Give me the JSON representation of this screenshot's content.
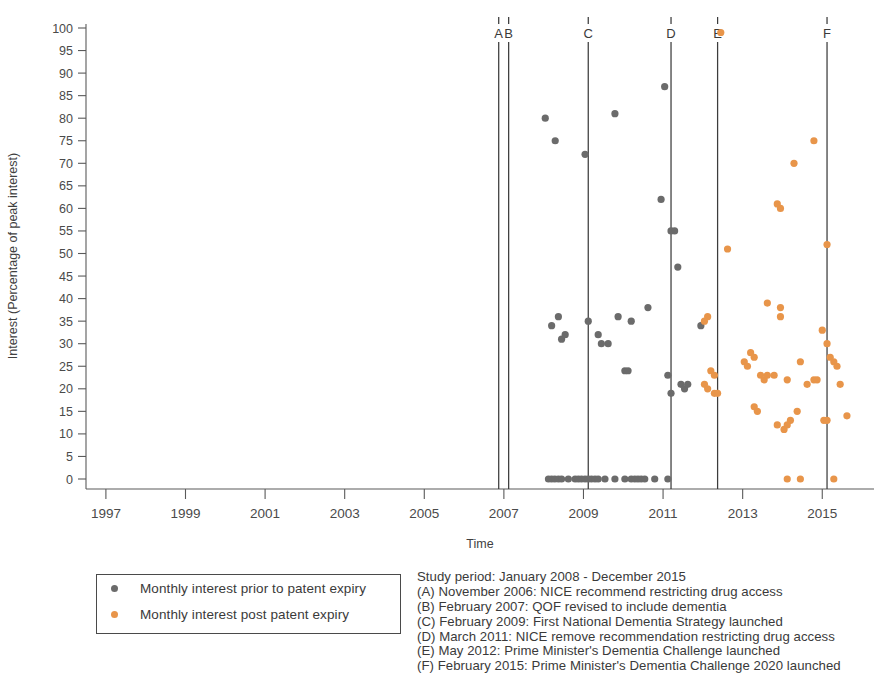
{
  "chart_data": {
    "type": "scatter",
    "title": "",
    "xlabel": "Time",
    "ylabel": "Interest (Percentage of peak interest)",
    "xlim": [
      1996.5,
      2016.3
    ],
    "ylim": [
      0,
      100
    ],
    "xticks": [
      "1997",
      "1999",
      "2001",
      "2003",
      "2005",
      "2007",
      "2009",
      "2011",
      "2013",
      "2015"
    ],
    "xtick_values": [
      1997,
      1999,
      2001,
      2003,
      2005,
      2007,
      2009,
      2011,
      2013,
      2015
    ],
    "yticks": [
      "0",
      "5",
      "10",
      "15",
      "20",
      "25",
      "30",
      "35",
      "40",
      "45",
      "50",
      "55",
      "60",
      "65",
      "70",
      "75",
      "80",
      "85",
      "90",
      "95",
      "100"
    ],
    "ytick_values": [
      0,
      5,
      10,
      15,
      20,
      25,
      30,
      35,
      40,
      45,
      50,
      55,
      60,
      65,
      70,
      75,
      80,
      85,
      90,
      95,
      100
    ],
    "grid": false,
    "legend_position": "below-left",
    "series": [
      {
        "name": "Monthly interest prior to patent expiry",
        "color": "#6b6b6b",
        "points": [
          [
            2008.12,
            0
          ],
          [
            2008.2,
            0
          ],
          [
            2008.28,
            0
          ],
          [
            2008.37,
            0
          ],
          [
            2008.45,
            0
          ],
          [
            2008.62,
            0
          ],
          [
            2008.79,
            0
          ],
          [
            2008.87,
            0
          ],
          [
            2008.95,
            0
          ],
          [
            2009.04,
            0
          ],
          [
            2009.12,
            0
          ],
          [
            2009.2,
            0
          ],
          [
            2009.29,
            0
          ],
          [
            2009.37,
            0
          ],
          [
            2009.54,
            0
          ],
          [
            2009.79,
            0
          ],
          [
            2010.04,
            0
          ],
          [
            2010.2,
            0
          ],
          [
            2010.29,
            0
          ],
          [
            2010.37,
            0
          ],
          [
            2010.45,
            0
          ],
          [
            2010.54,
            0
          ],
          [
            2010.79,
            0
          ],
          [
            2011.12,
            0
          ],
          [
            2008.04,
            80
          ],
          [
            2008.29,
            75
          ],
          [
            2009.04,
            72
          ],
          [
            2009.79,
            81
          ],
          [
            2011.04,
            87
          ],
          [
            2010.95,
            62
          ],
          [
            2011.2,
            55
          ],
          [
            2011.29,
            55
          ],
          [
            2011.37,
            47
          ],
          [
            2010.62,
            38
          ],
          [
            2010.2,
            35
          ],
          [
            2009.87,
            36
          ],
          [
            2008.37,
            36
          ],
          [
            2008.2,
            34
          ],
          [
            2008.45,
            31
          ],
          [
            2008.54,
            32
          ],
          [
            2009.12,
            35
          ],
          [
            2009.37,
            32
          ],
          [
            2009.45,
            30
          ],
          [
            2009.62,
            30
          ],
          [
            2010.04,
            24
          ],
          [
            2010.12,
            24
          ],
          [
            2011.12,
            23
          ],
          [
            2011.2,
            19
          ],
          [
            2011.45,
            21
          ],
          [
            2011.54,
            20
          ],
          [
            2011.62,
            21
          ],
          [
            2011.95,
            34
          ]
        ]
      },
      {
        "name": "Monthly interest post patent expiry",
        "color": "#e8954a",
        "points": [
          [
            2012.45,
            99
          ],
          [
            2014.79,
            75
          ],
          [
            2014.29,
            70
          ],
          [
            2013.87,
            61
          ],
          [
            2013.95,
            60
          ],
          [
            2015.12,
            52
          ],
          [
            2012.62,
            51
          ],
          [
            2013.62,
            39
          ],
          [
            2013.95,
            38
          ],
          [
            2013.95,
            36
          ],
          [
            2012.12,
            36
          ],
          [
            2012.04,
            35
          ],
          [
            2015.0,
            33
          ],
          [
            2015.12,
            30
          ],
          [
            2013.2,
            28
          ],
          [
            2013.29,
            27
          ],
          [
            2013.04,
            26
          ],
          [
            2013.12,
            25
          ],
          [
            2014.45,
            26
          ],
          [
            2015.2,
            27
          ],
          [
            2015.29,
            26
          ],
          [
            2015.37,
            25
          ],
          [
            2012.2,
            24
          ],
          [
            2012.29,
            23
          ],
          [
            2013.45,
            23
          ],
          [
            2013.54,
            22
          ],
          [
            2013.62,
            23
          ],
          [
            2013.79,
            23
          ],
          [
            2014.12,
            22
          ],
          [
            2014.62,
            21
          ],
          [
            2014.79,
            22
          ],
          [
            2014.87,
            22
          ],
          [
            2015.45,
            21
          ],
          [
            2012.04,
            21
          ],
          [
            2012.12,
            20
          ],
          [
            2012.29,
            19
          ],
          [
            2012.37,
            19
          ],
          [
            2013.29,
            16
          ],
          [
            2013.37,
            15
          ],
          [
            2014.37,
            15
          ],
          [
            2014.2,
            13
          ],
          [
            2015.04,
            13
          ],
          [
            2015.12,
            13
          ],
          [
            2015.62,
            14
          ],
          [
            2013.87,
            12
          ],
          [
            2014.04,
            11
          ],
          [
            2014.12,
            12
          ],
          [
            2014.12,
            0
          ],
          [
            2014.45,
            0
          ],
          [
            2015.29,
            0
          ]
        ]
      }
    ],
    "event_lines": [
      {
        "label": "A",
        "x": 2006.87
      },
      {
        "label": "B",
        "x": 2007.12
      },
      {
        "label": "C",
        "x": 2009.12
      },
      {
        "label": "D",
        "x": 2011.2
      },
      {
        "label": "E",
        "x": 2012.37
      },
      {
        "label": "F",
        "x": 2015.12
      }
    ]
  },
  "legend": {
    "items": [
      {
        "label": "Monthly interest prior to patent expiry",
        "color": "#6b6b6b"
      },
      {
        "label": "Monthly interest post patent expiry",
        "color": "#e8954a"
      }
    ]
  },
  "notes": {
    "lines": [
      "Study period: January 2008 - December 2015",
      "(A) November 2006: NICE recommend restricting drug access",
      "(B) February 2007: QOF revised to include dementia",
      "(C) February 2009: First National Dementia Strategy launched",
      "(D) March 2011: NICE remove recommendation restricting drug access",
      "(E) May 2012: Prime Minister's Dementia Challenge launched",
      "(F) February 2015: Prime Minister's Dementia Challenge 2020 launched"
    ]
  }
}
